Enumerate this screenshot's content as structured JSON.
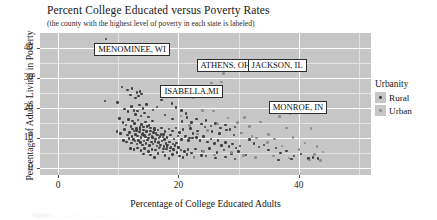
{
  "chart_data": {
    "type": "scatter",
    "title": "Percent College Educated versus Poverty Rates",
    "subtitle": "(the county with the highest level of poverty in each state is labeled)",
    "xlabel": "Percentage of College Educated Adults",
    "ylabel": "Percentage of Adults Living in Poverty",
    "xlim": [
      -3,
      52
    ],
    "ylim": [
      -2.5,
      45
    ],
    "xticks": [
      0,
      20,
      40
    ],
    "yticks": [
      0,
      10,
      20,
      30,
      40
    ],
    "xtick_labels": [
      "0",
      "20",
      "40"
    ],
    "ytick_labels": [
      "0",
      "10",
      "20",
      "30",
      "40"
    ],
    "grid": true,
    "legend": {
      "title": "Urbanity",
      "position": "right",
      "entries": [
        {
          "label": "Rural",
          "color": "#3e3e3e"
        },
        {
          "label": "Urban",
          "color": "#8d8d8d"
        }
      ]
    },
    "annotations": [
      {
        "text": "MENOMINEE, WI",
        "x": 8.0,
        "y": 43.0,
        "box_x": 6.0,
        "box_y": 40.0
      },
      {
        "text": "ATHENS, OH",
        "x": 27.5,
        "y": 31.5,
        "box_x": 23.0,
        "box_y": 34.5
      },
      {
        "text": "JACKSON, IL",
        "x": 34.2,
        "y": 32.3,
        "box_x": 31.5,
        "box_y": 34.8
      },
      {
        "text": "ISABELLA,MI",
        "x": 22.5,
        "y": 23.5,
        "box_x": 17.0,
        "box_y": 26.0
      },
      {
        "text": "MONROE, IN",
        "x": 38.5,
        "y": 18.0,
        "box_x": 35.0,
        "box_y": 20.5
      }
    ],
    "series": [
      {
        "name": "Rural",
        "color": "#3e3e3e",
        "points": [
          [
            8.0,
            43.0
          ],
          [
            7.8,
            22.2
          ],
          [
            9.9,
            21.8
          ],
          [
            10.6,
            27.0
          ],
          [
            11.5,
            26.0
          ],
          [
            12.0,
            24.2
          ],
          [
            12.3,
            26.4
          ],
          [
            12.9,
            23.3
          ],
          [
            13.1,
            25.1
          ],
          [
            13.4,
            24.0
          ],
          [
            13.6,
            25.4
          ],
          [
            13.9,
            24.6
          ],
          [
            11.0,
            19.5
          ],
          [
            11.6,
            18.7
          ],
          [
            12.2,
            20.4
          ],
          [
            12.6,
            19.1
          ],
          [
            12.9,
            17.8
          ],
          [
            13.2,
            18.9
          ],
          [
            13.5,
            20.9
          ],
          [
            13.8,
            17.2
          ],
          [
            14.1,
            19.8
          ],
          [
            14.4,
            18.2
          ],
          [
            14.7,
            21.0
          ],
          [
            15.0,
            16.9
          ],
          [
            10.2,
            16.4
          ],
          [
            10.8,
            15.1
          ],
          [
            11.3,
            14.2
          ],
          [
            11.7,
            16.0
          ],
          [
            12.1,
            13.8
          ],
          [
            12.4,
            15.6
          ],
          [
            12.7,
            14.7
          ],
          [
            13.0,
            13.1
          ],
          [
            13.3,
            15.9
          ],
          [
            13.6,
            12.8
          ],
          [
            13.9,
            14.4
          ],
          [
            14.2,
            13.5
          ],
          [
            14.5,
            15.2
          ],
          [
            14.8,
            12.3
          ],
          [
            15.1,
            14.0
          ],
          [
            15.4,
            13.2
          ],
          [
            15.7,
            15.5
          ],
          [
            16.0,
            12.6
          ],
          [
            9.8,
            12.0
          ],
          [
            10.4,
            11.4
          ],
          [
            11.0,
            12.7
          ],
          [
            11.5,
            10.9
          ],
          [
            11.9,
            11.8
          ],
          [
            12.3,
            10.3
          ],
          [
            12.6,
            12.2
          ],
          [
            12.9,
            11.1
          ],
          [
            13.2,
            10.5
          ],
          [
            13.5,
            11.9
          ],
          [
            13.8,
            10.0
          ],
          [
            14.1,
            11.5
          ],
          [
            14.4,
            10.7
          ],
          [
            14.7,
            12.1
          ],
          [
            15.0,
            9.8
          ],
          [
            15.3,
            11.2
          ],
          [
            15.6,
            10.4
          ],
          [
            15.9,
            11.7
          ],
          [
            16.2,
            9.6
          ],
          [
            16.5,
            10.8
          ],
          [
            16.8,
            9.9
          ],
          [
            17.1,
            11.0
          ],
          [
            17.4,
            10.2
          ],
          [
            17.7,
            9.4
          ],
          [
            10.9,
            9.1
          ],
          [
            11.4,
            8.6
          ],
          [
            11.8,
            9.7
          ],
          [
            12.2,
            8.2
          ],
          [
            12.5,
            9.3
          ],
          [
            12.8,
            8.8
          ],
          [
            13.1,
            7.9
          ],
          [
            13.4,
            9.0
          ],
          [
            13.7,
            8.4
          ],
          [
            14.0,
            7.6
          ],
          [
            14.3,
            8.9
          ],
          [
            14.6,
            8.1
          ],
          [
            14.9,
            9.2
          ],
          [
            15.2,
            7.4
          ],
          [
            15.5,
            8.5
          ],
          [
            15.8,
            7.8
          ],
          [
            16.1,
            8.7
          ],
          [
            16.4,
            7.2
          ],
          [
            16.7,
            8.3
          ],
          [
            17.0,
            7.6
          ],
          [
            17.3,
            8.8
          ],
          [
            17.6,
            7.0
          ],
          [
            17.9,
            8.0
          ],
          [
            18.2,
            7.5
          ],
          [
            18.5,
            8.6
          ],
          [
            18.8,
            6.9
          ],
          [
            19.1,
            7.9
          ],
          [
            19.4,
            7.3
          ],
          [
            19.7,
            8.2
          ],
          [
            20.0,
            6.7
          ],
          [
            12.0,
            6.4
          ],
          [
            12.6,
            6.0
          ],
          [
            13.2,
            6.6
          ],
          [
            13.8,
            5.7
          ],
          [
            14.4,
            6.3
          ],
          [
            15.0,
            5.4
          ],
          [
            15.6,
            6.1
          ],
          [
            16.2,
            5.9
          ],
          [
            16.8,
            6.5
          ],
          [
            17.4,
            5.2
          ],
          [
            18.0,
            6.2
          ],
          [
            18.6,
            5.6
          ],
          [
            19.2,
            6.0
          ],
          [
            19.8,
            5.0
          ],
          [
            20.4,
            5.8
          ],
          [
            21.0,
            5.3
          ],
          [
            21.6,
            6.1
          ],
          [
            22.2,
            4.8
          ],
          [
            14.2,
            4.5
          ],
          [
            15.4,
            4.2
          ],
          [
            16.6,
            4.7
          ],
          [
            17.8,
            4.0
          ],
          [
            19.0,
            4.4
          ],
          [
            20.2,
            3.9
          ],
          [
            21.4,
            4.3
          ],
          [
            22.6,
            3.6
          ],
          [
            23.8,
            4.1
          ],
          [
            16.0,
            3.3
          ],
          [
            18.4,
            3.0
          ],
          [
            20.8,
            3.4
          ],
          [
            21.2,
            10.6
          ],
          [
            21.8,
            9.8
          ],
          [
            22.4,
            11.3
          ],
          [
            23.0,
            10.1
          ],
          [
            23.6,
            9.0
          ],
          [
            24.2,
            10.4
          ],
          [
            24.8,
            8.6
          ],
          [
            25.4,
            9.5
          ],
          [
            26.0,
            8.0
          ],
          [
            26.6,
            9.1
          ],
          [
            27.2,
            7.4
          ],
          [
            27.8,
            8.3
          ],
          [
            28.4,
            7.0
          ],
          [
            29.0,
            7.8
          ],
          [
            29.6,
            6.5
          ],
          [
            30.2,
            7.2
          ],
          [
            22.0,
            13.0
          ],
          [
            23.2,
            12.2
          ],
          [
            24.4,
            13.6
          ],
          [
            25.6,
            12.0
          ],
          [
            26.8,
            11.4
          ],
          [
            28.0,
            12.5
          ],
          [
            29.2,
            10.8
          ],
          [
            30.4,
            11.6
          ],
          [
            22.8,
            6.2
          ],
          [
            24.0,
            5.6
          ],
          [
            25.2,
            6.4
          ],
          [
            26.4,
            5.0
          ],
          [
            27.6,
            5.8
          ],
          [
            28.8,
            4.6
          ],
          [
            30.0,
            5.4
          ],
          [
            31.2,
            4.2
          ],
          [
            24.6,
            3.8
          ],
          [
            26.2,
            3.2
          ],
          [
            27.8,
            3.6
          ],
          [
            29.4,
            2.9
          ],
          [
            31.8,
            9.3
          ],
          [
            32.6,
            8.1
          ],
          [
            33.4,
            6.8
          ],
          [
            34.2,
            7.6
          ],
          [
            35.0,
            5.9
          ],
          [
            36.2,
            6.6
          ],
          [
            37.0,
            4.8
          ],
          [
            38.0,
            5.5
          ],
          [
            39.2,
            3.9
          ],
          [
            40.4,
            4.6
          ],
          [
            41.6,
            3.0
          ],
          [
            42.4,
            3.4
          ],
          [
            43.2,
            3.1
          ],
          [
            36.6,
            2.6
          ],
          [
            38.8,
            2.8
          ],
          [
            19.6,
            20.1
          ],
          [
            20.5,
            19.0
          ],
          [
            21.3,
            18.1
          ],
          [
            18.9,
            21.5
          ],
          [
            17.2,
            22.6
          ],
          [
            16.4,
            20.3
          ],
          [
            15.8,
            19.2
          ],
          [
            17.8,
            17.5
          ],
          [
            19.0,
            16.2
          ],
          [
            20.6,
            15.4
          ],
          [
            21.4,
            16.8
          ],
          [
            22.2,
            15.0
          ],
          [
            23.0,
            16.3
          ],
          [
            23.8,
            14.5
          ],
          [
            24.6,
            15.7
          ],
          [
            25.4,
            13.9
          ],
          [
            26.2,
            14.8
          ],
          [
            27.0,
            13.2
          ],
          [
            27.8,
            14.2
          ],
          [
            28.6,
            12.8
          ],
          [
            29.4,
            13.5
          ],
          [
            16.9,
            6.8
          ],
          [
            17.5,
            6.2
          ],
          [
            18.1,
            7.1
          ],
          [
            18.7,
            6.5
          ],
          [
            19.3,
            5.9
          ],
          [
            19.9,
            6.8
          ],
          [
            14.0,
            11.0
          ],
          [
            14.5,
            10.2
          ],
          [
            15.1,
            10.9
          ],
          [
            15.7,
            10.1
          ],
          [
            16.3,
            11.4
          ],
          [
            16.9,
            10.3
          ],
          [
            17.5,
            11.1
          ],
          [
            18.1,
            10.0
          ],
          [
            18.7,
            10.8
          ],
          [
            19.3,
            9.6
          ],
          [
            19.9,
            10.5
          ],
          [
            20.5,
            9.3
          ],
          [
            21.1,
            10.2
          ],
          [
            21.7,
            9.0
          ],
          [
            22.3,
            9.9
          ],
          [
            12.4,
            12.9
          ],
          [
            13.0,
            12.4
          ],
          [
            13.6,
            13.4
          ],
          [
            14.2,
            12.6
          ],
          [
            14.8,
            13.8
          ],
          [
            15.4,
            12.2
          ],
          [
            16.0,
            13.1
          ],
          [
            16.6,
            12.5
          ],
          [
            17.2,
            13.3
          ],
          [
            17.8,
            12.1
          ],
          [
            18.4,
            12.9
          ],
          [
            19.0,
            12.3
          ],
          [
            19.6,
            13.2
          ],
          [
            20.2,
            11.8
          ],
          [
            20.8,
            12.7
          ]
        ]
      },
      {
        "name": "Urban",
        "color": "#8d8d8d",
        "points": [
          [
            27.5,
            31.5
          ],
          [
            34.2,
            32.3
          ],
          [
            22.5,
            23.5
          ],
          [
            38.5,
            18.0
          ],
          [
            25.5,
            28.2
          ],
          [
            27.2,
            28.6
          ],
          [
            24.0,
            19.0
          ],
          [
            25.8,
            18.9
          ],
          [
            31.0,
            16.8
          ],
          [
            36.8,
            17.0
          ],
          [
            33.6,
            15.3
          ],
          [
            42.0,
            13.0
          ],
          [
            38.0,
            13.2
          ],
          [
            29.8,
            15.0
          ],
          [
            31.8,
            13.8
          ],
          [
            35.0,
            11.0
          ],
          [
            36.0,
            9.5
          ],
          [
            39.0,
            10.0
          ],
          [
            41.0,
            8.2
          ],
          [
            43.0,
            7.0
          ],
          [
            33.0,
            9.8
          ],
          [
            34.8,
            8.4
          ],
          [
            30.5,
            11.5
          ],
          [
            32.2,
            10.4
          ],
          [
            37.2,
            7.2
          ],
          [
            40.0,
            6.0
          ],
          [
            44.0,
            5.2
          ],
          [
            42.6,
            4.4
          ],
          [
            28.2,
            16.5
          ],
          [
            26.5,
            14.6
          ],
          [
            24.8,
            12.4
          ],
          [
            23.2,
            11.2
          ],
          [
            21.8,
            14.0
          ],
          [
            20.4,
            17.2
          ],
          [
            35.8,
            3.8
          ],
          [
            38.4,
            3.2
          ],
          [
            41.8,
            2.6
          ],
          [
            43.6,
            2.4
          ],
          [
            30.8,
            4.0
          ],
          [
            32.8,
            3.4
          ],
          [
            28.8,
            5.0
          ],
          [
            26.0,
            4.2
          ],
          [
            24.2,
            5.4
          ],
          [
            22.6,
            3.4
          ]
        ]
      }
    ]
  },
  "caption_fragment": "Figure ....  ........ ...... ........ ......."
}
